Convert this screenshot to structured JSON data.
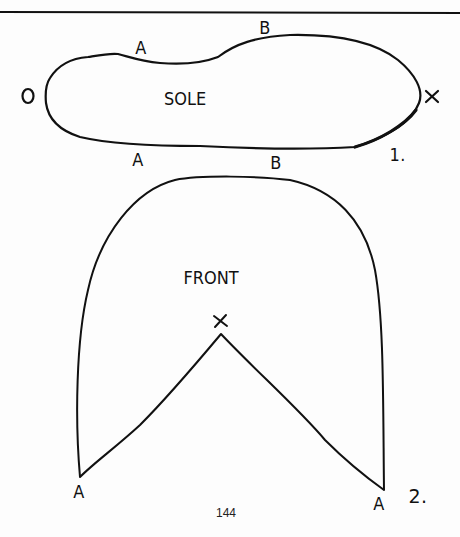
{
  "page": {
    "number": "144",
    "rule_color": "#111111",
    "ink_color": "#111111",
    "paper_color": "#fdfdfd"
  },
  "figure1": {
    "number": "1.",
    "title": "SOLE",
    "labels": {
      "heel_end": "O",
      "toe_end": "X",
      "top_a": "A",
      "top_b": "B",
      "bottom_a": "A",
      "bottom_b": "B"
    }
  },
  "figure2": {
    "number": "2.",
    "title": "FRONT",
    "apex_mark": "×",
    "labels": {
      "left_a": "A",
      "right_a": "A"
    }
  }
}
